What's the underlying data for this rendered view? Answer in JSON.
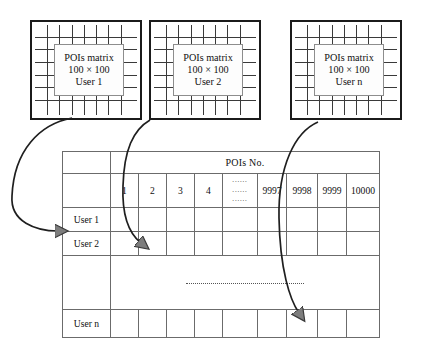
{
  "diagram": {
    "matrix_boxes": [
      {
        "line1": "POIs matrix",
        "line2": "100 × 100",
        "line3": "User 1"
      },
      {
        "line1": "POIs matrix",
        "line2": "100 × 100",
        "line3": "User 2"
      },
      {
        "line1": "POIs matrix",
        "line2": "100 × 100",
        "line3": "User n"
      }
    ],
    "table": {
      "header_title": "POIs No.",
      "corner_blank": "",
      "column_headers": [
        "1",
        "2",
        "3",
        "4",
        "……",
        "9997",
        "9998",
        "9999",
        "10000"
      ],
      "ellipsis_header_rows": [
        "......",
        "......",
        "......"
      ],
      "row_labels": [
        "User 1",
        "User 2",
        "",
        "User n"
      ],
      "vertical_ellipsis": "····················"
    },
    "arrows": [
      {
        "name": "arrow-user-1",
        "from": "matrix-box-1",
        "to": "table-row-user-1"
      },
      {
        "name": "arrow-user-2",
        "from": "matrix-box-2",
        "to": "table-row-user-2"
      },
      {
        "name": "arrow-user-n",
        "from": "matrix-box-3",
        "to": "table-row-user-n"
      }
    ],
    "colors": {
      "box_border": "#1b1b1b",
      "grid_line": "#3a3a3a",
      "table_border": "#6b6b6b",
      "header_shade": "#e8e8e8",
      "arrow_stroke": "#1f1f1f",
      "arrow_fill": "#7d7d7d"
    }
  }
}
